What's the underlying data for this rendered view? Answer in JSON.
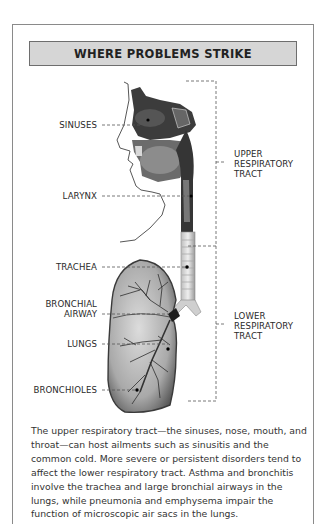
{
  "title": "WHERE PROBLEMS STRIKE",
  "labels": {
    "sinuses": "SINUSES",
    "larynx": "LARYNX",
    "trachea": "TRACHEA",
    "bronchial_airway_line1": "BRONCHIAL",
    "bronchial_airway_line2": "AIRWAY",
    "lungs": "LUNGS",
    "bronchioles": "BRONCHIOLES"
  },
  "brackets": {
    "upper": [
      "UPPER",
      "RESPIRATORY",
      "TRACT"
    ],
    "lower": [
      "LOWER",
      "RESPIRATORY",
      "TRACT"
    ]
  },
  "caption": "The upper respiratory tract—the sinuses, nose, mouth, and throat—can host ailments such as sinusitis and the common cold. More severe or persistent disorders tend to affect the lower respiratory tract. Asthma and bronchitis involve the trachea and large bronchial airways in the lungs, while pneumonia and emphysema impair the function of microscopic air sacs in the lungs.",
  "colors": {
    "banner_bg": "#d6d6d6",
    "frame": "#8a8a8a",
    "text": "#2a2a2a"
  }
}
